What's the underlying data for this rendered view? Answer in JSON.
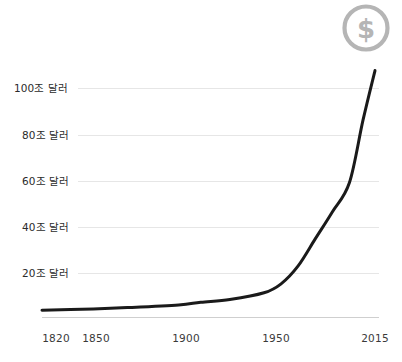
{
  "badge": {
    "name": "dollar-badge",
    "glyph": "$",
    "color": "#b5b5b5"
  },
  "chart_data": {
    "type": "line",
    "title": "",
    "subtitle": "",
    "xlabel": "",
    "ylabel": "",
    "grid": true,
    "legend": "none",
    "line_color": "#1a1a1a",
    "grid_color": "#e6e6e6",
    "axis_color": "#cfcfcf",
    "xlim": [
      1820,
      2015
    ],
    "ylim": [
      0,
      115
    ],
    "x_tick_labels": [
      "1820",
      "1850",
      "1900",
      "1950",
      "2015"
    ],
    "x_ticks": [
      1820,
      1850,
      1900,
      1950,
      2015
    ],
    "y_tick_labels": [
      "20조 달러",
      "40조 달러",
      "60조 달러",
      "80조 달러",
      "100조 달러"
    ],
    "y_ticks": [
      20,
      40,
      60,
      80,
      100
    ],
    "y_unit": "조 달러",
    "series": [
      {
        "name": "world-gdp",
        "x": [
          1820,
          1850,
          1870,
          1900,
          1913,
          1930,
          1950,
          1960,
          1970,
          1980,
          1990,
          2000,
          2008,
          2015
        ],
        "values": [
          1.2,
          1.8,
          2.4,
          3.6,
          4.8,
          6.0,
          9.0,
          13.0,
          21.0,
          33.0,
          45.0,
          58.0,
          86.0,
          108.0
        ]
      }
    ]
  }
}
